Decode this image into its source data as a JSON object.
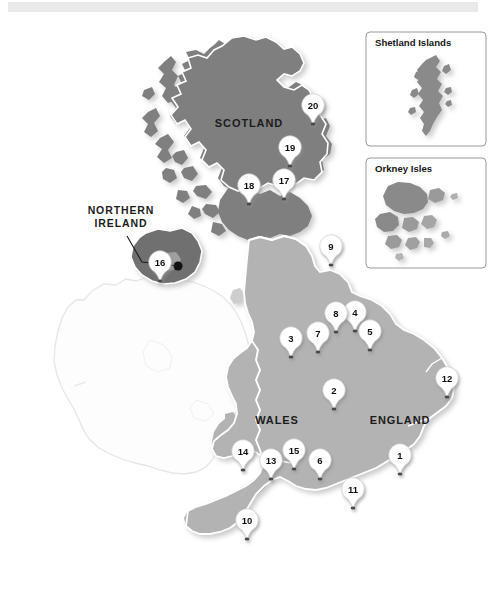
{
  "figure": {
    "background_color": "#ffffff",
    "top_bar_color": "#e9e9e9"
  },
  "colors": {
    "scotland_fill": "#7f7f7f",
    "northern_ireland_fill": "#707070",
    "england_wales_fill": "#b3b3b3",
    "ireland_fill": "#fcfcfc",
    "ireland_stroke": "#e2e2e2",
    "coast_stroke": "#ffffff",
    "pin_fill": "#ffffff",
    "pin_text": "#111111",
    "label_text": "#1c1c1c",
    "inset_border": "#9a9a9a",
    "shadow": "#d7d7d7"
  },
  "region_labels": [
    {
      "id": "scotland",
      "text": "SCOTLAND",
      "x": 249,
      "y": 127,
      "size": "lg"
    },
    {
      "id": "northern-ireland-line1",
      "text": "NORTHERN",
      "x": 121,
      "y": 214,
      "size": "sm"
    },
    {
      "id": "northern-ireland-line2",
      "text": "IRELAND",
      "x": 121,
      "y": 227,
      "size": "sm"
    },
    {
      "id": "wales",
      "text": "WALES",
      "x": 277,
      "y": 424,
      "size": "lg"
    },
    {
      "id": "england",
      "text": "ENGLAND",
      "x": 400,
      "y": 424,
      "size": "lg"
    }
  ],
  "leader": {
    "name": "northern-ireland-leader",
    "path": "M 127 236 L 142 262 L 178 266",
    "dot": {
      "x": 178,
      "y": 266,
      "r": 4.6
    }
  },
  "insets": [
    {
      "id": "shetland",
      "title": "Shetland Islands",
      "box": {
        "x": 366,
        "y": 32,
        "width": 120,
        "height": 114
      },
      "title_x": 375,
      "title_y": 46
    },
    {
      "id": "orkney",
      "title": "Orkney Isles",
      "box": {
        "x": 366,
        "y": 158,
        "width": 120,
        "height": 110
      },
      "title_x": 375,
      "title_y": 172
    }
  ],
  "pins": [
    {
      "label": "1",
      "x": 400,
      "y": 455,
      "name": "pin-1"
    },
    {
      "label": "2",
      "x": 334,
      "y": 390,
      "name": "pin-2"
    },
    {
      "label": "3",
      "x": 291,
      "y": 338,
      "name": "pin-3"
    },
    {
      "label": "4",
      "x": 355,
      "y": 312,
      "name": "pin-4"
    },
    {
      "label": "5",
      "x": 370,
      "y": 331,
      "name": "pin-5"
    },
    {
      "label": "6",
      "x": 320,
      "y": 460,
      "name": "pin-6"
    },
    {
      "label": "7",
      "x": 318,
      "y": 333,
      "name": "pin-7"
    },
    {
      "label": "8",
      "x": 336,
      "y": 313,
      "name": "pin-8"
    },
    {
      "label": "9",
      "x": 331,
      "y": 246,
      "name": "pin-9"
    },
    {
      "label": "10",
      "x": 247,
      "y": 520,
      "name": "pin-10"
    },
    {
      "label": "11",
      "x": 353,
      "y": 489,
      "name": "pin-11"
    },
    {
      "label": "12",
      "x": 447,
      "y": 378,
      "name": "pin-12"
    },
    {
      "label": "13",
      "x": 271,
      "y": 460,
      "name": "pin-13"
    },
    {
      "label": "14",
      "x": 243,
      "y": 451,
      "name": "pin-14"
    },
    {
      "label": "15",
      "x": 294,
      "y": 450,
      "name": "pin-15"
    },
    {
      "label": "16",
      "x": 160,
      "y": 262,
      "name": "pin-16"
    },
    {
      "label": "17",
      "x": 284,
      "y": 180,
      "name": "pin-17"
    },
    {
      "label": "18",
      "x": 249,
      "y": 185,
      "name": "pin-18"
    },
    {
      "label": "19",
      "x": 290,
      "y": 147,
      "name": "pin-19"
    },
    {
      "label": "20",
      "x": 313,
      "y": 105,
      "name": "pin-20"
    }
  ]
}
